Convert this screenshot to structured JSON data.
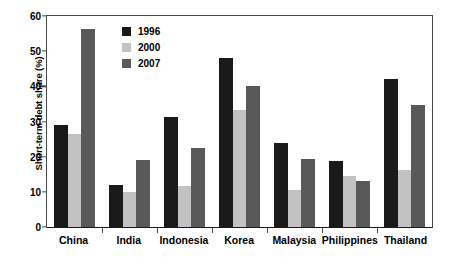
{
  "chart_data": {
    "type": "bar",
    "title": "",
    "xlabel": "",
    "ylabel": "Short-term debt share (%)",
    "ylim": [
      0,
      60
    ],
    "yticks": [
      0,
      10,
      20,
      30,
      40,
      50,
      60
    ],
    "grid": false,
    "legend_position": "top-left-inside",
    "categories": [
      "China",
      "India",
      "Indonesia",
      "Korea",
      "Malaysia",
      "Philippines",
      "Thailand"
    ],
    "series": [
      {
        "name": "1996",
        "color": "#1a1a1a",
        "values": [
          29,
          12,
          31.2,
          48.2,
          24,
          18.8,
          42
        ]
      },
      {
        "name": "2000",
        "color": "#c2c2c2",
        "values": [
          26.5,
          10,
          11.8,
          33.3,
          10.5,
          14.5,
          16.1
        ]
      },
      {
        "name": "2007",
        "color": "#595959",
        "values": [
          56.2,
          19,
          22.4,
          40.2,
          19.2,
          13,
          34.8
        ]
      }
    ]
  }
}
